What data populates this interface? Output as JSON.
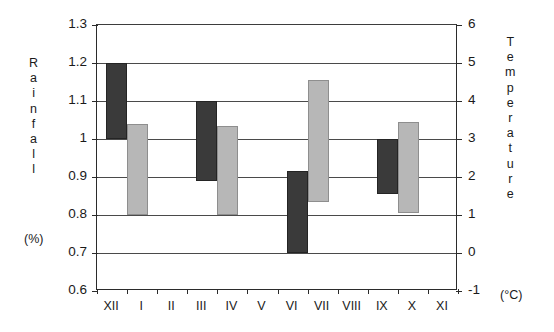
{
  "chart_data": {
    "type": "bar",
    "title": "",
    "subtitle": "",
    "xlabel": "",
    "ylabel": "Rainfall",
    "ylabel_unit": "(%)",
    "y2label": "Temperature",
    "y2label_unit": "(°C)",
    "grid": true,
    "legend": "none",
    "bar_style": "floating range bars (min–max)",
    "categories": [
      "XII",
      "I",
      "II",
      "III",
      "IV",
      "V",
      "VI",
      "VII",
      "VIII",
      "IX",
      "X",
      "XI"
    ],
    "x_tick_labels": [
      "XII",
      "I",
      "II",
      "III",
      "IV",
      "V",
      "VI",
      "VII",
      "VIII",
      "IX",
      "X",
      "XI"
    ],
    "ylim": [
      0.6,
      1.3
    ],
    "y_tick_labels": [
      "1.3",
      "1.2",
      "1.1",
      "1",
      "0.9",
      "0.8",
      "0.7",
      "0.6"
    ],
    "y_tick_values": [
      1.3,
      1.2,
      1.1,
      1.0,
      0.9,
      0.8,
      0.7,
      0.6
    ],
    "y2lim": [
      -1,
      6
    ],
    "y2_tick_labels": [
      "6",
      "5",
      "4",
      "3",
      "2",
      "1",
      "0",
      "-1"
    ],
    "y2_tick_values": [
      6,
      5,
      4,
      3,
      2,
      1,
      0,
      -1
    ],
    "colors": {
      "rainfall_bar": "#3a3a3a",
      "temperature_bar": "#b7b7b7",
      "axis": "#2b2b2b",
      "grid": "#4a4a4a",
      "background": "#ffffff"
    },
    "series": [
      {
        "name": "Rainfall",
        "axis": "left",
        "unit": "%",
        "color": "#3a3a3a",
        "bars": [
          {
            "category": "I",
            "low": 1.0,
            "high": 1.2
          },
          {
            "category": "IV",
            "low": 0.89,
            "high": 1.1
          },
          {
            "category": "VII",
            "low": 0.7,
            "high": 0.915
          },
          {
            "category": "X",
            "low": 0.855,
            "high": 1.0
          }
        ]
      },
      {
        "name": "Temperature",
        "axis": "right",
        "unit": "°C",
        "color": "#b7b7b7",
        "bars": [
          {
            "category": "I",
            "low": 2.0,
            "high": 4.4
          },
          {
            "category": "IV",
            "low": 2.0,
            "high": 4.35
          },
          {
            "category": "VII",
            "low": 2.35,
            "high": 5.55
          },
          {
            "category": "X",
            "low": 2.05,
            "high": 4.45
          }
        ]
      }
    ],
    "bar_pairs": [
      {
        "slot": 1,
        "label": "I",
        "dark_low": 1.0,
        "dark_high": 1.2,
        "light_low": 0.8,
        "light_high": 1.04
      },
      {
        "slot": 4,
        "label": "IV",
        "dark_low": 0.89,
        "dark_high": 1.1,
        "light_low": 0.8,
        "light_high": 1.035
      },
      {
        "slot": 7,
        "label": "VII",
        "dark_low": 0.7,
        "dark_high": 0.915,
        "light_low": 0.835,
        "light_high": 1.155
      },
      {
        "slot": 10,
        "label": "X",
        "dark_low": 0.855,
        "dark_high": 1.0,
        "light_low": 0.805,
        "light_high": 1.045
      }
    ]
  },
  "axes": {
    "left_caption_letters": [
      "R",
      "a",
      "i",
      "n",
      "f",
      "a",
      "l",
      "l"
    ],
    "left_caption_unit": "(%)",
    "right_caption_letters": [
      "T",
      "e",
      "m",
      "p",
      "e",
      "r",
      "a",
      "t",
      "u",
      "r",
      "e"
    ],
    "right_caption_unit": "(°C)"
  }
}
